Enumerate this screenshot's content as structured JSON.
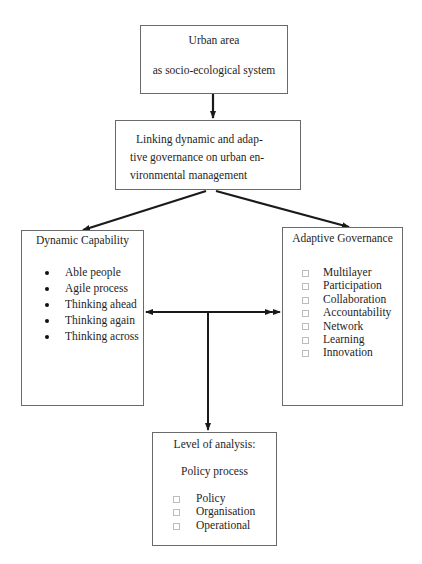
{
  "diagram": {
    "type": "flowchart",
    "nodes": {
      "top": {
        "line1": "Urban area",
        "line2": "as socio-ecological system"
      },
      "middle": {
        "text": "Linking dynamic and adap-tive governance on urban en-vironmental management"
      },
      "left": {
        "title": "Dynamic Capability",
        "bullet_style": "filled-circle",
        "items": [
          "Able people",
          "Agile process",
          "Thinking ahead",
          "Thinking again",
          "Thinking across"
        ]
      },
      "right": {
        "title": "Adaptive Governance",
        "bullet_style": "hollow-square",
        "items": [
          "Multilayer",
          "Participation",
          "Collaboration",
          "Accountability",
          "Network",
          "Learning",
          "Innovation"
        ]
      },
      "bottom": {
        "title": "Level of analysis:",
        "subtitle": "Policy process",
        "bullet_style": "hollow-square",
        "items": [
          "Policy",
          "Organisation",
          "Operational"
        ]
      }
    },
    "edges": [
      {
        "from": "top",
        "to": "middle",
        "style": "arrow"
      },
      {
        "from": "middle",
        "to": "left",
        "style": "arrow"
      },
      {
        "from": "middle",
        "to": "right",
        "style": "arrow"
      },
      {
        "from": "left",
        "to": "right",
        "style": "double-arrow"
      },
      {
        "from": "left-right-connector",
        "to": "bottom",
        "style": "arrow"
      }
    ],
    "colors": {
      "box_border": "#6a6a6a",
      "arrow": "#1a1a1a",
      "text": "#1e1e1e",
      "square_bullet": "#bdbdbd"
    }
  }
}
